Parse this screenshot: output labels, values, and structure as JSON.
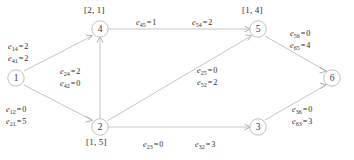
{
  "diagram": {
    "type": "directed-graph",
    "title": "",
    "nodes": [
      {
        "id": "1",
        "label": "1",
        "x": 16,
        "y": 78,
        "bracket": null
      },
      {
        "id": "2",
        "label": "2",
        "x": 100,
        "y": 127,
        "bracket": "[1, 5]"
      },
      {
        "id": "3",
        "label": "3",
        "x": 258,
        "y": 127,
        "bracket": null
      },
      {
        "id": "4",
        "label": "4",
        "x": 100,
        "y": 29,
        "bracket": "[2, 1]"
      },
      {
        "id": "5",
        "label": "5",
        "x": 258,
        "y": 29,
        "bracket": "[1, 4]"
      },
      {
        "id": "6",
        "label": "6",
        "x": 332,
        "y": 78,
        "bracket": null
      }
    ],
    "edge_labels": [
      {
        "id": "e14-e41",
        "x": 8,
        "y": 41,
        "lines": [
          {
            "sym": "e",
            "sub": "14",
            "op": "=",
            "val": "2"
          },
          {
            "sym": "e",
            "sub": "41",
            "op": "=",
            "val": "2"
          }
        ]
      },
      {
        "id": "e12-e21",
        "x": 6,
        "y": 104,
        "lines": [
          {
            "sym": "e",
            "sub": "12",
            "op": "=",
            "val": "0"
          },
          {
            "sym": "e",
            "sub": "21",
            "op": "=",
            "val": "5"
          }
        ]
      },
      {
        "id": "e24-e42",
        "x": 60,
        "y": 66,
        "lines": [
          {
            "sym": "e",
            "sub": "24",
            "op": "=",
            "val": "2"
          },
          {
            "sym": "e",
            "sub": "42",
            "op": "=",
            "val": "0"
          }
        ]
      },
      {
        "id": "e45",
        "x": 136,
        "y": 17,
        "lines": [
          {
            "sym": "e",
            "sub": "45",
            "op": "=",
            "val": "1"
          }
        ]
      },
      {
        "id": "e54",
        "x": 192,
        "y": 17,
        "lines": [
          {
            "sym": "e",
            "sub": "54",
            "op": "=",
            "val": "2"
          }
        ]
      },
      {
        "id": "e25-e52",
        "x": 197,
        "y": 65,
        "lines": [
          {
            "sym": "e",
            "sub": "25",
            "op": "=",
            "val": "0"
          },
          {
            "sym": "e",
            "sub": "52",
            "op": "=",
            "val": "2"
          }
        ]
      },
      {
        "id": "e56-e65",
        "x": 290,
        "y": 28,
        "lines": [
          {
            "sym": "e",
            "sub": "56",
            "op": "=",
            "val": "0"
          },
          {
            "sym": "e",
            "sub": "65",
            "op": "=",
            "val": "4"
          }
        ]
      },
      {
        "id": "e36-e63",
        "x": 292,
        "y": 104,
        "lines": [
          {
            "sym": "e",
            "sub": "36",
            "op": "=",
            "val": "0"
          },
          {
            "sym": "e",
            "sub": "63",
            "op": "=",
            "val": "3"
          }
        ]
      },
      {
        "id": "e23",
        "x": 143,
        "y": 139,
        "lines": [
          {
            "sym": "e",
            "sub": "23",
            "op": "=",
            "val": "0"
          }
        ]
      },
      {
        "id": "e32",
        "x": 195,
        "y": 139,
        "lines": [
          {
            "sym": "e",
            "sub": "32",
            "op": "=",
            "val": "3"
          }
        ]
      }
    ],
    "colors": {
      "line": "#bdbdbd",
      "node_stroke": "#b9b9b9",
      "text": "#2e2e2e",
      "background": "#ffffff"
    }
  }
}
